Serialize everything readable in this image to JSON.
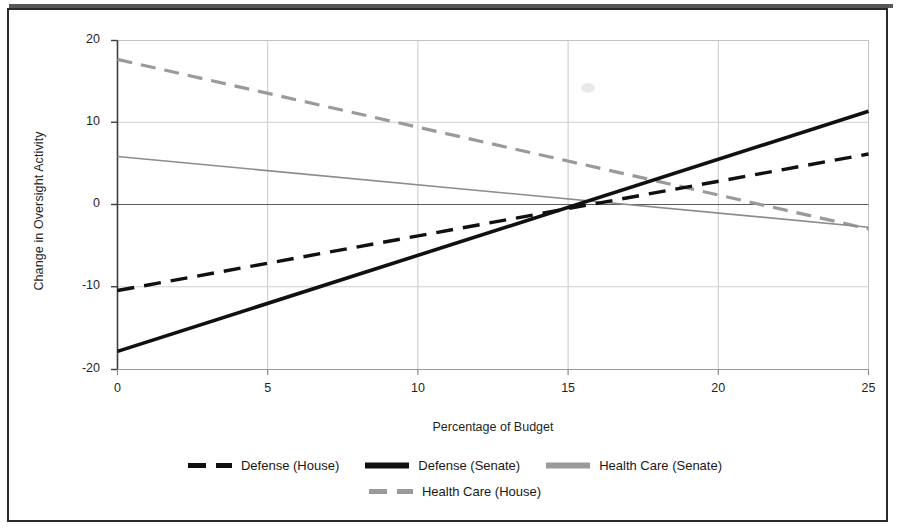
{
  "figure": {
    "border_color": "#2b2b2b",
    "background": "#ffffff"
  },
  "axes": {
    "x_title": "Percentage of Budget",
    "y_title": "Change in Oversight Activity",
    "x_ticks": [
      "0",
      "5",
      "10",
      "15",
      "20",
      "25"
    ],
    "y_ticks": [
      "20",
      "10",
      "0",
      "-10",
      "-20"
    ]
  },
  "legend": {
    "rows": [
      [
        {
          "label": "Defense (House)",
          "style": "dashed",
          "color": "#101010",
          "width": 5,
          "name": "legend-item-defense-house"
        },
        {
          "label": "Defense (Senate)",
          "style": "solid",
          "color": "#101010",
          "width": 6,
          "name": "legend-item-defense-senate"
        },
        {
          "label": "Health Care (Senate)",
          "style": "solid",
          "color": "#9a9a9a",
          "width": 6,
          "name": "legend-item-health-care-senate"
        }
      ],
      [
        {
          "label": "Health Care (House)",
          "style": "dashed",
          "color": "#9a9a9a",
          "width": 5,
          "name": "legend-item-health-care-house"
        }
      ]
    ]
  },
  "chart_data": {
    "type": "line",
    "title": "",
    "xlabel": "Percentage of Budget",
    "ylabel": "Change in Oversight Activity",
    "xlim": [
      0,
      25
    ],
    "ylim": [
      -20,
      20
    ],
    "xticks": [
      0,
      5,
      10,
      15,
      20,
      25
    ],
    "yticks": [
      -20,
      -10,
      0,
      10,
      20
    ],
    "grid": true,
    "grid_color": "#c8c8c8",
    "legend_position": "bottom",
    "x": [
      0,
      25
    ],
    "series": [
      {
        "name": "Defense (Senate)",
        "values": [
          -17.8,
          11.4
        ],
        "color": "#101010",
        "linestyle": "solid",
        "linewidth": 3.6,
        "zero_crossing_x": 15.2
      },
      {
        "name": "Defense (House)",
        "values": [
          -10.4,
          6.2
        ],
        "color": "#101010",
        "linestyle": "dashed",
        "linewidth": 3.4,
        "zero_crossing_x": 15.6
      },
      {
        "name": "Health Care (House)",
        "values": [
          17.7,
          -2.9
        ],
        "color": "#9a9a9a",
        "linestyle": "dashed",
        "linewidth": 3.2,
        "zero_crossing_x": 21.5
      },
      {
        "name": "Health Care (Senate)",
        "values": [
          5.9,
          -2.7
        ],
        "color": "#8c8c8c",
        "linestyle": "solid",
        "linewidth": 1.6,
        "zero_crossing_x": 17.2
      }
    ]
  }
}
